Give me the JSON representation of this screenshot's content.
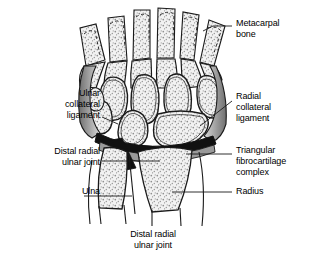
{
  "figure": {
    "view": "anterior-coronal-section",
    "colors": {
      "outline": "#1a1a1a",
      "bone_fill": "#f2f2f2",
      "stipple": "#8c8c8c",
      "ligament_shade": "#9a9a9a",
      "cartilage_dark": "#111111",
      "background": "#ffffff",
      "text": "#000000",
      "leader": "#1a1a1a"
    }
  },
  "labels": {
    "metacarpal": "Metacarpal\nbone",
    "ulnar_collateral": "Ulnar\ncollateral\nligament",
    "radial_collateral": "Radial\ncollateral\nligament",
    "distal_radial_ulnar_joint": "Distal radial\nulnar joint",
    "tfcc": "Triangular\nfibrocartilage\ncomplex",
    "ulna": "Ulna",
    "radius": "Radius",
    "caption": "Distal radial\nulnar joint"
  },
  "structures": {
    "metacarpal_count": 5,
    "carpal_rows": [
      "distal",
      "proximal"
    ],
    "forearm_bones": [
      "Ulna",
      "Radius"
    ]
  }
}
